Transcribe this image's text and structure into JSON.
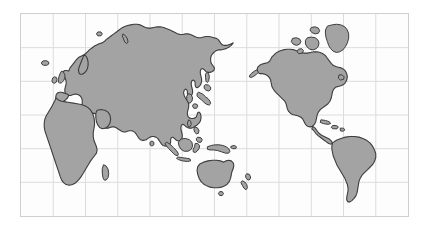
{
  "figure": {
    "kind": "world-map",
    "projection": "pacific-centered rectangular",
    "background_color": "#ffffff",
    "ocean_color": "#fdfdfd",
    "land_fill_color": "#a3a3a3",
    "land_outline_color": "#3d3d3d",
    "grid_line_color": "#dcdcdc",
    "frame_border_color": "#cfcfcf"
  },
  "frame": {
    "x": 20,
    "y": 13,
    "width": 389,
    "height": 204
  },
  "graticule": {
    "visible": true,
    "columns": 12,
    "rows": 6,
    "vertical_line_count": 11,
    "horizontal_line_count": 5,
    "vertical_positions": [
      8.33,
      16.67,
      25,
      33.33,
      41.67,
      50,
      58.33,
      66.67,
      75,
      83.33,
      91.67
    ],
    "horizontal_positions": [
      16.67,
      33.33,
      50,
      66.67,
      83.33
    ]
  },
  "landmasses": [
    {
      "name": "eurasia",
      "label": "Eurasia"
    },
    {
      "name": "africa",
      "label": "Africa"
    },
    {
      "name": "british-isles",
      "label": "British Isles"
    },
    {
      "name": "ireland",
      "label": "Ireland"
    },
    {
      "name": "japan",
      "label": "Japan"
    },
    {
      "name": "hokkaido",
      "label": "Hokkaido"
    },
    {
      "name": "taiwan",
      "label": "Taiwan"
    },
    {
      "name": "sri-lanka",
      "label": "Sri Lanka"
    },
    {
      "name": "madagascar",
      "label": "Madagascar"
    },
    {
      "name": "sumatra",
      "label": "Sumatra"
    },
    {
      "name": "java",
      "label": "Java"
    },
    {
      "name": "borneo",
      "label": "Borneo"
    },
    {
      "name": "sulawesi",
      "label": "Sulawesi"
    },
    {
      "name": "philippines",
      "label": "Philippines"
    },
    {
      "name": "new-guinea",
      "label": "New Guinea"
    },
    {
      "name": "australia",
      "label": "Australia"
    },
    {
      "name": "tasmania",
      "label": "Tasmania"
    },
    {
      "name": "new-zealand-north",
      "label": "New Zealand North Island"
    },
    {
      "name": "new-zealand-south",
      "label": "New Zealand South Island"
    },
    {
      "name": "north-america",
      "label": "North America"
    },
    {
      "name": "greenland",
      "label": "Greenland"
    },
    {
      "name": "baffin-island",
      "label": "Baffin Island"
    },
    {
      "name": "newfoundland",
      "label": "Newfoundland"
    },
    {
      "name": "cuba",
      "label": "Cuba"
    },
    {
      "name": "hispaniola",
      "label": "Hispaniola"
    },
    {
      "name": "south-america",
      "label": "South America"
    },
    {
      "name": "iceland",
      "label": "Iceland"
    },
    {
      "name": "svalbard",
      "label": "Svalbard"
    },
    {
      "name": "novaya-zemlya",
      "label": "Novaya Zemlya"
    },
    {
      "name": "sakhalin",
      "label": "Sakhalin"
    },
    {
      "name": "kamchatka-tip",
      "label": "Kamchatka"
    },
    {
      "name": "victoria-island",
      "label": "Victoria Island"
    },
    {
      "name": "ellesmere-island",
      "label": "Ellesmere Island"
    }
  ]
}
